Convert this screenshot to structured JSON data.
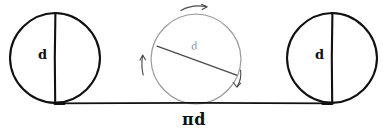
{
  "figure": {
    "background_color": "#ffffff",
    "ink_color": "#111111",
    "faint_ink_color": "#9a9a9a"
  },
  "labels": {
    "left_circle_diameter": "d",
    "middle_circle_diameter": "d",
    "right_circle_diameter": "d",
    "baseline_length": "πd"
  },
  "shapes": {
    "left_circle": {
      "name": "left-circle",
      "cx": 55,
      "cy": 58,
      "r": 45,
      "stroke": "#111111",
      "stroke_width": 2.1,
      "diameter_line": {
        "x1": 55,
        "y1": 13,
        "x2": 55,
        "y2": 103,
        "orientation": "vertical"
      }
    },
    "middle_circle": {
      "name": "middle-circle",
      "cx": 196,
      "cy": 59,
      "r": 45,
      "stroke": "#9a9a9a",
      "stroke_width": 1.2,
      "diameter_line": {
        "x1": 157,
        "y1": 46,
        "x2": 236,
        "y2": 75,
        "orientation": "diagonal",
        "angle_degrees": 20
      }
    },
    "right_circle": {
      "name": "right-circle",
      "cx": 332,
      "cy": 58,
      "r": 45,
      "stroke": "#111111",
      "stroke_width": 2.1,
      "diameter_line": {
        "x1": 332,
        "y1": 13,
        "x2": 332,
        "y2": 103,
        "orientation": "vertical"
      }
    },
    "baseline": {
      "name": "baseline",
      "x1": 55,
      "y1": 103,
      "x2": 332,
      "y2": 103,
      "stroke": "#111111",
      "stroke_width": 1.6
    }
  },
  "rotation_arrows": [
    {
      "name": "rotation-arrow-top",
      "position": "top",
      "direction": "clockwise-right"
    },
    {
      "name": "rotation-arrow-left",
      "position": "left",
      "direction": "upward"
    },
    {
      "name": "rotation-arrow-right",
      "position": "lower-right",
      "direction": "downward"
    }
  ]
}
